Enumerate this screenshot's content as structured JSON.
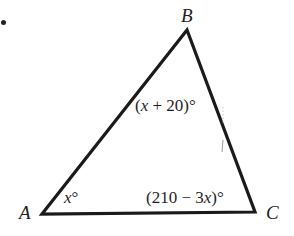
{
  "figure": {
    "type": "triangle",
    "vertices": {
      "A": {
        "label": "A",
        "x": 42,
        "y": 214
      },
      "B": {
        "label": "B",
        "x": 187,
        "y": 30
      },
      "C": {
        "label": "C",
        "x": 255,
        "y": 212
      }
    },
    "angles": {
      "A": {
        "prefix": "",
        "var": "x",
        "suffix": "°"
      },
      "B": {
        "prefix": "(",
        "var": "x",
        "suffix": " + 20)°"
      },
      "C": {
        "prefix": "(210 − 3",
        "var": "x",
        "suffix": ")°"
      }
    },
    "stroke_color": "#1a1a1a",
    "background": "#ffffff",
    "bullet_marker": "•"
  }
}
